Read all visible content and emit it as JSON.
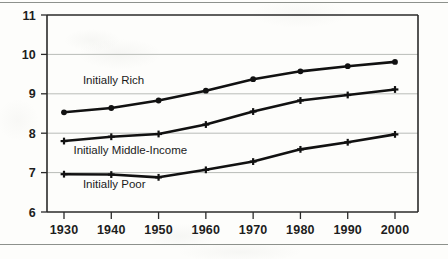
{
  "chart_data": {
    "type": "line",
    "title": "",
    "xlabel": "",
    "ylabel": "",
    "categories": [
      1930,
      1940,
      1950,
      1960,
      1970,
      1980,
      1990,
      2000
    ],
    "xlim": [
      1925,
      2005
    ],
    "ylim": [
      6,
      11
    ],
    "yticks": [
      6,
      7,
      8,
      9,
      10,
      11
    ],
    "xticks": [
      1930,
      1940,
      1950,
      1960,
      1970,
      1980,
      1990,
      2000
    ],
    "grid": true,
    "legend": "inline-annotations",
    "series": [
      {
        "name": "Initially Rich",
        "marker": "dot",
        "values": [
          8.53,
          8.64,
          8.83,
          9.08,
          9.37,
          9.57,
          9.7,
          9.81
        ]
      },
      {
        "name": "Initially Middle-Income",
        "marker": "cross",
        "values": [
          7.8,
          7.91,
          7.98,
          8.22,
          8.55,
          8.83,
          8.97,
          9.11
        ]
      },
      {
        "name": "Initially Poor",
        "marker": "cross",
        "values": [
          6.96,
          6.95,
          6.88,
          7.07,
          7.28,
          7.59,
          7.77,
          7.97
        ]
      }
    ],
    "annotations": [
      {
        "text": "Initially Rich",
        "x": 1934,
        "y": 9.25
      },
      {
        "text": "Initially Middle-Income",
        "x": 1932,
        "y": 7.47
      },
      {
        "text": "Initially Poor",
        "x": 1934,
        "y": 6.6
      }
    ]
  },
  "axis": {
    "ytick_labels": [
      "11",
      "10",
      "9",
      "8",
      "7",
      "6"
    ],
    "xtick_labels": [
      "1930",
      "1940",
      "1950",
      "1960",
      "1970",
      "1980",
      "1990",
      "2000"
    ]
  },
  "style": {
    "line_color": "#111111",
    "grid_color": "#b9bcb8",
    "axis_color": "#2a2a2a",
    "background": "#fdfdfb"
  }
}
